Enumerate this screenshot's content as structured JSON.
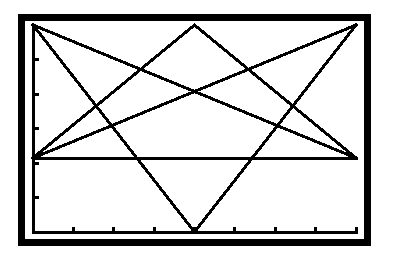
{
  "screen": {
    "background": "#ffffff",
    "ink": "#000000",
    "frame": {
      "outer": [
        18,
        14,
        371,
        246
      ],
      "thickness": 7
    }
  },
  "chart_data": {
    "type": "line",
    "title": "",
    "xlabel": "",
    "ylabel": "",
    "grid": false,
    "legend": null,
    "xlim": [
      0,
      8
    ],
    "ylim": [
      -2,
      4
    ],
    "x_ticks": [
      0,
      1,
      2,
      3,
      4,
      5,
      6,
      7,
      8
    ],
    "y_ticks": [
      -2,
      -1,
      0,
      1,
      2,
      3,
      4
    ],
    "tick_labels_visible": false,
    "series": [
      {
        "name": "segment-1",
        "x": [
          0,
          8
        ],
        "y": [
          4,
          0
        ]
      },
      {
        "name": "segment-2",
        "x": [
          0,
          4
        ],
        "y": [
          4,
          -2
        ]
      },
      {
        "name": "segment-3",
        "x": [
          4,
          8
        ],
        "y": [
          -2,
          4
        ]
      },
      {
        "name": "segment-4",
        "x": [
          0,
          4
        ],
        "y": [
          0,
          4
        ]
      },
      {
        "name": "segment-5",
        "x": [
          4,
          8
        ],
        "y": [
          4,
          0
        ]
      },
      {
        "name": "segment-6",
        "x": [
          0,
          8
        ],
        "y": [
          0,
          4
        ]
      },
      {
        "name": "x-axis",
        "x": [
          0,
          8
        ],
        "y": [
          0,
          0
        ]
      }
    ]
  },
  "plot_box_px": {
    "left": 33,
    "top": 25,
    "right": 356,
    "bottom": 232,
    "zero_y": 158
  },
  "caption": "Calculator graph screen: star figure of six line segments over a horizontal axis"
}
